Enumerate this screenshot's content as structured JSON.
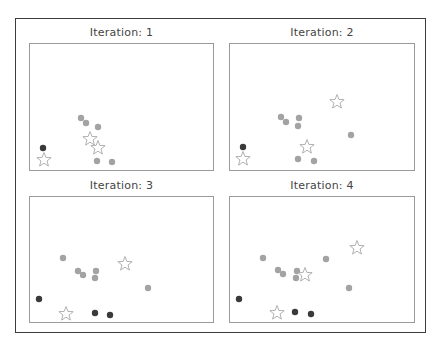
{
  "figure": {
    "frame_color": "#3c3c3c",
    "axes_border_color": "#9a9a9a"
  },
  "colors": {
    "point_gray": "#a3a3a3",
    "point_dark": "#3a3a3a",
    "star_outline": "#a8a8a8"
  },
  "chart_data": [
    {
      "type": "scatter",
      "title": "Iteration: 1",
      "xlabel": "",
      "ylabel": "",
      "grid": false,
      "axes_px": {
        "x": 29,
        "y": 43,
        "w": 185,
        "h": 128
      },
      "series": [
        {
          "name": "unassigned",
          "marker": "circle",
          "color": "#a3a3a3",
          "points": [
            [
              51,
              74
            ],
            [
              56,
              79
            ],
            [
              68,
              83
            ],
            [
              67,
              117
            ],
            [
              82,
              118
            ]
          ]
        },
        {
          "name": "cluster",
          "marker": "circle",
          "color": "#3a3a3a",
          "points": [
            [
              13,
              104
            ]
          ]
        },
        {
          "name": "centroids",
          "marker": "star",
          "color": "#a8a8a8",
          "points": [
            [
              14,
              116
            ],
            [
              60,
              95
            ],
            [
              68,
              104
            ]
          ]
        }
      ]
    },
    {
      "type": "scatter",
      "title": "Iteration: 2",
      "xlabel": "",
      "ylabel": "",
      "grid": false,
      "axes_px": {
        "x": 229,
        "y": 43,
        "w": 186,
        "h": 128
      },
      "series": [
        {
          "name": "unassigned",
          "marker": "circle",
          "color": "#a3a3a3",
          "points": [
            [
              51,
              73
            ],
            [
              56,
              78
            ],
            [
              69,
              74
            ],
            [
              68,
              82
            ],
            [
              121,
              91
            ],
            [
              68,
              115
            ],
            [
              84,
              117
            ]
          ]
        },
        {
          "name": "cluster",
          "marker": "circle",
          "color": "#3a3a3a",
          "points": [
            [
              13,
              103
            ]
          ]
        },
        {
          "name": "centroids",
          "marker": "star",
          "color": "#a8a8a8",
          "points": [
            [
              13,
              115
            ],
            [
              77,
              103
            ],
            [
              107,
              58
            ]
          ]
        }
      ]
    },
    {
      "type": "scatter",
      "title": "Iteration: 3",
      "xlabel": "",
      "ylabel": "",
      "grid": false,
      "axes_px": {
        "x": 29,
        "y": 196,
        "w": 185,
        "h": 127
      },
      "series": [
        {
          "name": "unassigned",
          "marker": "circle",
          "color": "#a3a3a3",
          "points": [
            [
              33,
              61
            ],
            [
              48,
              74
            ],
            [
              53,
              78
            ],
            [
              66,
              74
            ],
            [
              65,
              81
            ],
            [
              118,
              91
            ]
          ]
        },
        {
          "name": "cluster",
          "marker": "circle",
          "color": "#3a3a3a",
          "points": [
            [
              9,
              102
            ],
            [
              65,
              116
            ],
            [
              80,
              118
            ]
          ]
        },
        {
          "name": "centroids",
          "marker": "star",
          "color": "#a8a8a8",
          "points": [
            [
              36,
              117
            ],
            [
              95,
              67
            ]
          ]
        }
      ]
    },
    {
      "type": "scatter",
      "title": "Iteration: 4",
      "xlabel": "",
      "ylabel": "",
      "grid": false,
      "axes_px": {
        "x": 229,
        "y": 196,
        "w": 186,
        "h": 127
      },
      "series": [
        {
          "name": "unassigned",
          "marker": "circle",
          "color": "#a3a3a3",
          "points": [
            [
              33,
              61
            ],
            [
              48,
              73
            ],
            [
              53,
              77
            ],
            [
              67,
              74
            ],
            [
              66,
              81
            ],
            [
              96,
              62
            ],
            [
              119,
              91
            ]
          ]
        },
        {
          "name": "cluster",
          "marker": "circle",
          "color": "#3a3a3a",
          "points": [
            [
              9,
              102
            ],
            [
              65,
              115
            ],
            [
              81,
              117
            ]
          ]
        },
        {
          "name": "centroids",
          "marker": "star",
          "color": "#a8a8a8",
          "points": [
            [
              47,
              116
            ],
            [
              75,
              78
            ],
            [
              127,
              51
            ]
          ]
        }
      ]
    }
  ]
}
